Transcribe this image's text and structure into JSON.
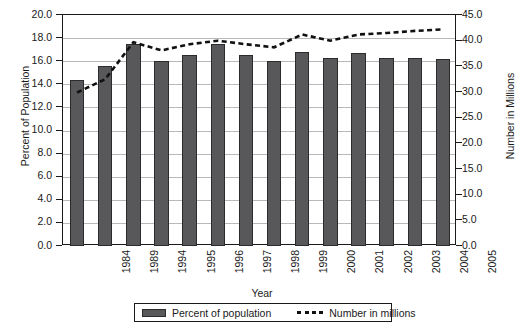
{
  "chart_data": {
    "type": "bar",
    "title": "",
    "xlabel": "Year",
    "ylabel": "Percent of Population",
    "ylabel_secondary": "Number in Millions",
    "categories": [
      "1984",
      "1989",
      "1994",
      "1995",
      "1996",
      "1997",
      "1998",
      "1999",
      "2000",
      "2001",
      "2002",
      "2003",
      "2004",
      "2005"
    ],
    "ylim": [
      0.0,
      20.0
    ],
    "ylim_secondary": [
      0.0,
      45.0
    ],
    "yticks": [
      "0.0",
      "2.0",
      "4.0",
      "6.0",
      "8.0",
      "10.0",
      "12.0",
      "14.0",
      "16.0",
      "18.0",
      "20.0"
    ],
    "yticks_secondary": [
      "0.0",
      "5.0",
      "10.0",
      "15.0",
      "20.0",
      "25.0",
      "30.0",
      "35.0",
      "40.0",
      "45.0"
    ],
    "grid": true,
    "legend_position": "bottom",
    "series": [
      {
        "name": "Percent of population",
        "type": "bar",
        "axis": "left",
        "color": "#58585a",
        "values": [
          14.4,
          15.6,
          17.5,
          16.0,
          16.5,
          17.5,
          16.5,
          16.0,
          16.8,
          16.3,
          16.7,
          16.3,
          16.3,
          16.2
        ]
      },
      {
        "name": "Number in millions",
        "type": "line",
        "axis": "right",
        "style": "dotted",
        "color": "#111111",
        "values": [
          29.9,
          32.5,
          39.7,
          38.1,
          39.3,
          40.0,
          39.3,
          38.7,
          41.2,
          40.0,
          41.2,
          41.5,
          41.9,
          42.2
        ]
      }
    ]
  },
  "legend": {
    "bar_label": "Percent of population",
    "line_label": "Number in millions"
  }
}
